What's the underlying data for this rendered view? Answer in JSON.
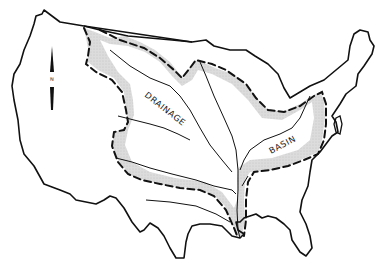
{
  "map": {
    "subject": "Contiguous United States",
    "labels": {
      "word1": "DRAINAGE",
      "word2": "BASIN"
    },
    "north_arrow": {
      "letter": "N"
    },
    "colors": {
      "outline": "#111111",
      "basin_shading": "#d4d4d4",
      "background": "#ffffff"
    }
  }
}
